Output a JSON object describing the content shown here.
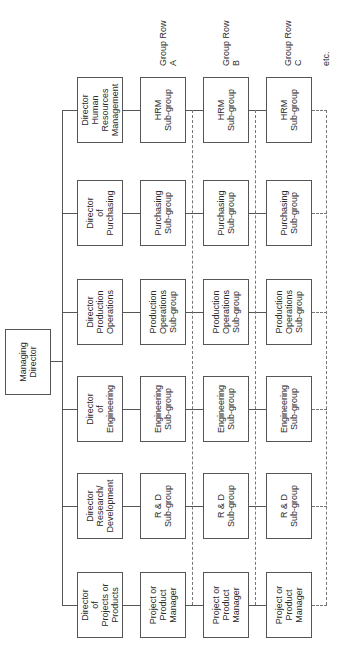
{
  "diagram": {
    "type": "organization-chart",
    "orientation": "rotated-90-ccw",
    "root": {
      "label": "Managing\nDirector"
    },
    "directors": [
      {
        "label": "Director\nHuman\nResources\nManagement",
        "subgroup": "HRM\nSub-group"
      },
      {
        "label": "Director\nof\nPurchasing",
        "subgroup": "Purchasing\nSub-group"
      },
      {
        "label": "Director\nProduction\nOperations",
        "subgroup": "Production\nOperations\nSub-group"
      },
      {
        "label": "Director\nof\nEngineering",
        "subgroup": "Engineering\nSub-group"
      },
      {
        "label": "Director\nResearch/\nDevelopment",
        "subgroup": "R & D\nSub-group"
      },
      {
        "label": "Director\nof\nProjects or\nProducts",
        "subgroup": "Project or\nProduct\nManager"
      }
    ],
    "group_rows": [
      {
        "label": "Group Row\nA"
      },
      {
        "label": "Group Row\nB"
      },
      {
        "label": "Group Row\nC"
      }
    ],
    "continuation_label": "etc."
  }
}
